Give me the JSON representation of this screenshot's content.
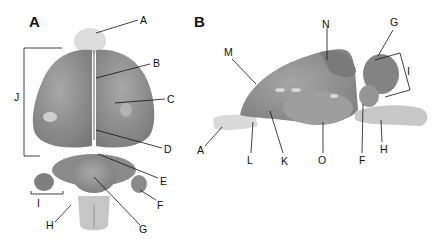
{
  "panels": [
    {
      "id": "A",
      "letter": "A",
      "view": "dorsal view of brain",
      "labels": {
        "A": "A",
        "B": "B",
        "C": "C",
        "D": "D",
        "E": "E",
        "F": "F",
        "G": "G",
        "H": "H",
        "I": "I",
        "J": "J"
      }
    },
    {
      "id": "B",
      "letter": "B",
      "view": "lateral view of brain",
      "labels": {
        "A": "A",
        "F": "F",
        "G": "G",
        "H": "H",
        "I": "I",
        "K": "K",
        "L": "L",
        "M": "M",
        "N": "N",
        "O": "O"
      }
    }
  ],
  "colors": {
    "tissue": "#8d8d8d",
    "tissue_light": "#b9b9b9",
    "tissue_dark": "#6f6f6f",
    "bulb": "#d9d9d9",
    "line": "#111111",
    "background": "#ffffff"
  }
}
